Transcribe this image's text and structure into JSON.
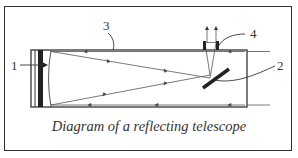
{
  "diagram": {
    "title": "Diagram of a reflecting telescope",
    "labels": [
      {
        "id": "1",
        "text": "1",
        "part": "primary-mirror"
      },
      {
        "id": "2",
        "text": "2",
        "part": "secondary-flat-mirror"
      },
      {
        "id": "3",
        "text": "3",
        "part": "tube"
      },
      {
        "id": "4",
        "text": "4",
        "part": "eyepiece"
      }
    ],
    "colors": {
      "line": "#333333",
      "background": "#ffffff"
    }
  }
}
